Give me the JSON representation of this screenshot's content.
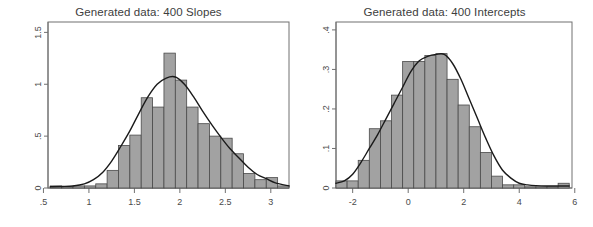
{
  "figure": {
    "width": 593,
    "height": 227,
    "background": "#ffffff",
    "bar_fill": "#a2a2a2",
    "bar_stroke": "#4a4a4a",
    "density_color": "#1a1a1a",
    "frame_color": "#707070",
    "text_color": "#3d3d3d"
  },
  "panels": [
    {
      "id": "slopes",
      "title": "Generated data: 400 Slopes"
    },
    {
      "id": "intercepts",
      "title": "Generated data: 400 Intercepts"
    }
  ],
  "chart_data": [
    {
      "type": "histogram",
      "title": "Generated data: 400 Slopes",
      "xlabel": "",
      "ylabel": "",
      "grid": false,
      "legend": null,
      "n": 400,
      "xlim": [
        0.55,
        3.2
      ],
      "ylim": [
        0,
        1.6
      ],
      "xticks": [
        0.5,
        1,
        1.5,
        2,
        2.5,
        3
      ],
      "xticklabels": [
        ".5",
        "1",
        "1.5",
        "2",
        "2.5",
        "3"
      ],
      "yticks": [
        0,
        0.5,
        1,
        1.5
      ],
      "yticklabels": [
        "0",
        ".5",
        "1",
        "1.5"
      ],
      "bin_width": 0.125,
      "bin_edges": [
        0.575,
        0.7,
        0.825,
        0.95,
        1.075,
        1.2,
        1.325,
        1.45,
        1.575,
        1.7,
        1.825,
        1.95,
        2.075,
        2.2,
        2.325,
        2.45,
        2.575,
        2.7,
        2.825,
        2.95,
        3.075,
        3.2
      ],
      "densities": [
        0.02,
        0.0,
        0.02,
        0.02,
        0.04,
        0.17,
        0.41,
        0.51,
        0.87,
        0.78,
        1.3,
        1.04,
        0.78,
        0.62,
        0.5,
        0.48,
        0.33,
        0.14,
        0.08,
        0.1,
        0.02
      ],
      "density_curve": {
        "name": "kernel density",
        "x": [
          0.575,
          0.7,
          0.825,
          0.95,
          1.05,
          1.15,
          1.25,
          1.35,
          1.45,
          1.55,
          1.65,
          1.75,
          1.85,
          1.95,
          2.05,
          2.15,
          2.25,
          2.35,
          2.45,
          2.55,
          2.65,
          2.75,
          2.85,
          2.95,
          3.05,
          3.2
        ],
        "y": [
          0.012,
          0.015,
          0.02,
          0.04,
          0.08,
          0.15,
          0.26,
          0.4,
          0.55,
          0.72,
          0.88,
          1.0,
          1.06,
          1.07,
          1.0,
          0.88,
          0.74,
          0.61,
          0.49,
          0.38,
          0.29,
          0.2,
          0.13,
          0.09,
          0.05,
          0.02
        ]
      }
    },
    {
      "type": "histogram",
      "title": "Generated data: 400 Intercepts",
      "xlabel": "",
      "ylabel": "",
      "grid": false,
      "legend": null,
      "n": 400,
      "xlim": [
        -2.6,
        5.9
      ],
      "ylim": [
        0,
        0.42
      ],
      "xticks": [
        -2,
        0,
        2,
        4,
        6
      ],
      "xticklabels": [
        "-2",
        "0",
        "2",
        "4",
        "6"
      ],
      "yticks": [
        0,
        0.1,
        0.2,
        0.3,
        0.4
      ],
      "yticklabels": [
        "0",
        ".1",
        ".2",
        ".3",
        ".4"
      ],
      "bin_width": 0.4,
      "bin_edges": [
        -2.6,
        -2.2,
        -1.8,
        -1.4,
        -1.0,
        -0.6,
        -0.2,
        0.2,
        0.6,
        1.0,
        1.4,
        1.8,
        2.2,
        2.6,
        3.0,
        3.4,
        3.8,
        4.2,
        4.6,
        5.0,
        5.4,
        5.8
      ],
      "densities": [
        0.018,
        0.018,
        0.07,
        0.15,
        0.17,
        0.235,
        0.32,
        0.32,
        0.335,
        0.34,
        0.275,
        0.21,
        0.155,
        0.09,
        0.03,
        0.008,
        0.008,
        0.0,
        0.0,
        0.0,
        0.012
      ],
      "density_curve": {
        "name": "kernel density",
        "x": [
          -2.6,
          -2.3,
          -2.0,
          -1.7,
          -1.4,
          -1.1,
          -0.8,
          -0.5,
          -0.2,
          0.1,
          0.4,
          0.7,
          1.0,
          1.3,
          1.6,
          1.9,
          2.2,
          2.5,
          2.8,
          3.1,
          3.4,
          3.7,
          4.0,
          4.3,
          4.6,
          5.0,
          5.4,
          5.8
        ],
        "y": [
          0.012,
          0.018,
          0.035,
          0.065,
          0.1,
          0.135,
          0.175,
          0.215,
          0.255,
          0.295,
          0.322,
          0.333,
          0.338,
          0.338,
          0.315,
          0.275,
          0.225,
          0.175,
          0.125,
          0.08,
          0.045,
          0.025,
          0.012,
          0.008,
          0.006,
          0.005,
          0.005,
          0.005
        ]
      }
    }
  ]
}
